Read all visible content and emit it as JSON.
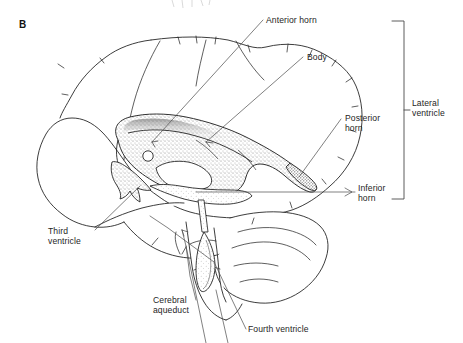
{
  "figure": {
    "panel_letter": "B"
  },
  "labels": {
    "anterior_horn": "Anterior horn",
    "body": "Body",
    "posterior_horn": "Posterior\nhorn",
    "inferior_horn": "Inferior\nhorn",
    "lateral_ventricle": "Lateral\nventricle",
    "third_ventricle": "Third\nventricle",
    "cerebral_aqueduct": "Cerebral\naqueduct",
    "fourth_ventricle": "Fourth ventricle"
  },
  "colors": {
    "ink": "#1a1a1a",
    "label_text": "#252525",
    "leader_line": "#4a4a4a",
    "bracket": "#4a4a4a",
    "stipple": "#6e6e6e",
    "background": "#ffffff"
  }
}
